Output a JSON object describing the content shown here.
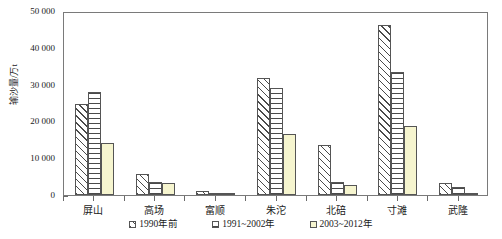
{
  "chart_data": {
    "type": "bar",
    "title": "",
    "xlabel": "",
    "ylabel": "输沙量/万t",
    "ylim": [
      0,
      50000
    ],
    "ytick_labels": [
      "0",
      "10 000",
      "20 000",
      "30 000",
      "40 000",
      "50 000"
    ],
    "ytick_values": [
      0,
      10000,
      20000,
      30000,
      40000,
      50000
    ],
    "grid": false,
    "legend_position": "bottom-center",
    "categories": [
      "屏山",
      "高场",
      "富顺",
      "朱沱",
      "北碚",
      "寸滩",
      "武隆"
    ],
    "series": [
      {
        "name": "1990年前",
        "pattern": "diagonal-hatch",
        "values": [
          24800,
          5800,
          1200,
          31800,
          13500,
          46200,
          3400
        ]
      },
      {
        "name": "1991~2002年",
        "pattern": "horizontal-hatch",
        "values": [
          28000,
          3600,
          500,
          29000,
          3500,
          33500,
          2100
        ]
      },
      {
        "name": "2003~2012年",
        "pattern": "solid-pale-yellow",
        "values": [
          14100,
          3200,
          300,
          16500,
          2700,
          18800,
          400
        ]
      }
    ]
  },
  "colors": {
    "hatch_line": "#4a4a4a",
    "series3_fill": "#f6f5cf",
    "bar_border": "#555555",
    "axis": "#7a7a7a",
    "text": "#1a1a1a"
  }
}
